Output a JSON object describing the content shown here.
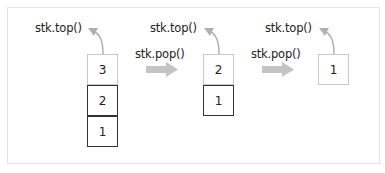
{
  "diagram": {
    "stages": [
      {
        "top_label": "stk.top()",
        "cells": [
          "3",
          "2",
          "1"
        ]
      },
      {
        "top_label": "stk.top()",
        "cells": [
          "2",
          "1"
        ]
      },
      {
        "top_label": "stk.top()",
        "cells": [
          "1"
        ]
      }
    ],
    "operations": [
      {
        "label": "stk.pop()"
      },
      {
        "label": "stk.pop()"
      }
    ],
    "colors": {
      "arrow": "#c4c4c4",
      "dark_border": "#333333",
      "light_border": "#c8c8c8"
    }
  }
}
